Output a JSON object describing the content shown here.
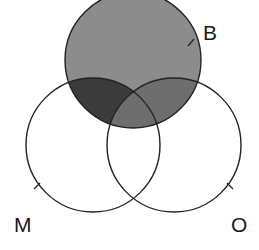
{
  "diagram": {
    "type": "venn-3",
    "sets": [
      {
        "id": "B",
        "label": "B",
        "cx": 133,
        "cy": 60,
        "r": 68,
        "label_x": 203,
        "label_y": 40,
        "tick": [
          188,
          46,
          194,
          39
        ]
      },
      {
        "id": "M",
        "label": "M",
        "cx": 93,
        "cy": 145,
        "r": 67,
        "label_x": 14,
        "label_y": 232,
        "tick": [
          34,
          189,
          40,
          183
        ]
      },
      {
        "id": "O",
        "label": "O",
        "cx": 174,
        "cy": 145,
        "r": 67,
        "label_x": 231,
        "label_y": 232,
        "tick": [
          227,
          183,
          233,
          189
        ]
      }
    ],
    "regions": {
      "B_only": {
        "fill": "#8c8c8c",
        "shaded": true
      },
      "B_and_M_only": {
        "fill": "#3b3b3b",
        "shaded": true
      },
      "B_and_O_only": {
        "fill": "#6e6e6e",
        "shaded": true
      },
      "B_and_M_and_O": {
        "fill": "#6e6e6e",
        "shaded": true
      },
      "M_only": {
        "fill": "#ffffff",
        "shaded": false
      },
      "O_only": {
        "fill": "#ffffff",
        "shaded": false
      },
      "M_and_O_only": {
        "fill": "#ffffff",
        "shaded": false
      }
    },
    "stroke_color": "#222222",
    "stroke_width": 1.4
  }
}
